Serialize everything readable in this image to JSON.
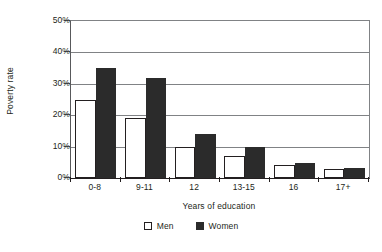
{
  "chart_data": {
    "type": "bar",
    "title": "",
    "subtitle": "",
    "xlabel": "Years of education",
    "ylabel": "Poverty rate",
    "categories": [
      "0-8",
      "9-11",
      "12",
      "13-15",
      "16",
      "17+"
    ],
    "series": [
      {
        "name": "Men",
        "values": [
          25,
          19,
          10,
          7,
          4,
          3
        ],
        "color": "#ffffff",
        "edge_color": "#231f20"
      },
      {
        "name": "Women",
        "values": [
          35,
          32,
          14,
          10,
          4.7,
          3.2
        ],
        "color": "#2b2b2b",
        "edge_color": "#2b2b2b"
      }
    ],
    "ylim": [
      0,
      50
    ],
    "ytick_values": [
      0,
      10,
      20,
      30,
      40,
      50
    ],
    "ytick_labels": [
      "0%",
      "10%",
      "20%",
      "30%",
      "40%",
      "50%"
    ],
    "grid": "horizontal",
    "legend_position": "below-axis",
    "legend_entries": [
      "Men",
      "Women"
    ],
    "bar_grouping": "grouped",
    "value_unit": "percent"
  },
  "axes": {
    "y_title": "Poverty rate",
    "x_title": "Years of education"
  },
  "legend": {
    "men_label": "Men",
    "women_label": "Women"
  },
  "colors": {
    "men_fill": "#ffffff",
    "women_fill": "#2b2b2b",
    "axis": "#231f20",
    "grid": "#808285"
  }
}
